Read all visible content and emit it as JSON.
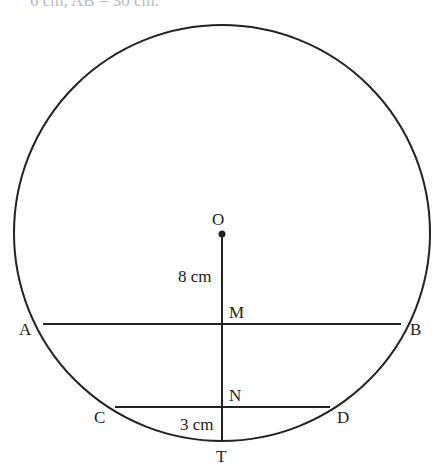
{
  "header": {
    "clipped_text": "6 cm, AB = 30 cm."
  },
  "diagram": {
    "circle": {
      "cx": 222,
      "cy": 233,
      "r": 208
    },
    "center": {
      "label": "O",
      "x": 222,
      "y": 233
    },
    "chord_AB": {
      "A": {
        "label": "A",
        "x": 43,
        "y": 324
      },
      "B": {
        "label": "B",
        "x": 400,
        "y": 324
      }
    },
    "chord_CD": {
      "C": {
        "label": "C",
        "x": 116,
        "y": 407
      },
      "D": {
        "label": "D",
        "x": 331,
        "y": 407
      }
    },
    "points": {
      "M": "M",
      "N": "N",
      "T": "T"
    },
    "measurements": {
      "OM": "8 cm",
      "NT": "3 cm"
    }
  },
  "labels": {
    "O": "O",
    "A": "A",
    "B": "B",
    "C": "C",
    "D": "D",
    "M": "M",
    "N": "N",
    "T": "T",
    "om_length": "8 cm",
    "nt_length": "3 cm"
  }
}
